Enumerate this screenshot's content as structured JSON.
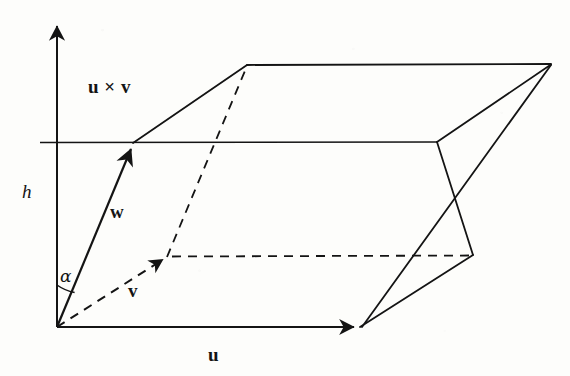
{
  "figure": {
    "background_color": "#fdfdfb",
    "ink_color": "#141414",
    "width": 570,
    "height": 376
  },
  "labels": {
    "cross_product": "u × v",
    "cross_product_u": "u",
    "cross_product_times": "×",
    "cross_product_v": "v",
    "height": "h",
    "vector_w": "w",
    "vector_v": "v",
    "vector_u": "u",
    "angle_alpha": "α"
  },
  "geometry": {
    "origin": [
      57,
      327
    ],
    "axis_tip": [
      57,
      22
    ],
    "vector_u_tip": [
      360,
      327
    ],
    "vector_v_tip": [
      166,
      258
    ],
    "vector_w_tip": [
      133,
      145
    ],
    "horizontal_line_left": [
      40,
      142
    ],
    "horizontal_line_right": [
      437,
      142
    ],
    "top_face_left": [
      247,
      65
    ],
    "top_face_right": [
      551,
      64
    ],
    "mid_face_right": [
      473,
      255
    ],
    "stroke_width": 1.9,
    "dash_pattern": "9 7"
  },
  "label_positions": {
    "cross_product": [
      88,
      86
    ],
    "height": [
      22,
      182
    ],
    "vector_w": [
      110,
      202
    ],
    "vector_v": [
      128,
      281
    ],
    "vector_u": [
      208,
      345
    ],
    "angle_alpha": [
      60,
      268
    ]
  }
}
